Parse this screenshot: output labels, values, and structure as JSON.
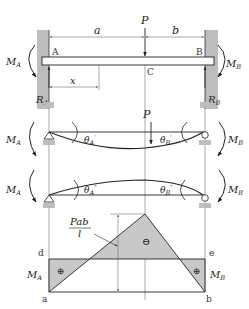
{
  "figure": {
    "colors": {
      "ink": "#222222",
      "fill_gray": "#c8c8c8",
      "wall_gray": "#bdbdbd",
      "background": "#ffffff"
    }
  },
  "panel1": {
    "load_label": "P",
    "dim_a": "a",
    "dim_b": "b",
    "dim_x": "x",
    "point_A": "A",
    "point_B": "B",
    "point_C": "C",
    "moment_left": "M",
    "moment_left_sub": "A",
    "moment_right": "M",
    "moment_right_sub": "B",
    "reaction_left": "R",
    "reaction_left_sub": "A",
    "reaction_right": "R",
    "reaction_right_sub": "B"
  },
  "panel2": {
    "load_label": "P",
    "moment_left": "M",
    "moment_left_sub": "A",
    "moment_right": "M",
    "moment_right_sub": "B",
    "theta_left": "θ",
    "theta_left_sub": "A",
    "theta_left_sup": "′",
    "theta_right": "θ",
    "theta_right_sub": "B",
    "theta_right_sup": "′"
  },
  "panel3": {
    "moment_left": "M",
    "moment_left_sub": "A",
    "moment_right": "M",
    "moment_right_sub": "B",
    "theta_left": "θ",
    "theta_left_sub": "A",
    "theta_left_sup": "″",
    "theta_right": "θ",
    "theta_right_sub": "B",
    "theta_right_sup": "″"
  },
  "moment_diagram": {
    "peak_label_num": "Pab",
    "peak_label_den": "l",
    "sign_center": "⊖",
    "sign_left": "⊕",
    "sign_right": "⊕",
    "point_a": "a",
    "point_b": "b",
    "point_d": "d",
    "point_e": "e",
    "moment_left": "M",
    "moment_left_sub": "A",
    "moment_right": "M",
    "moment_right_sub": "B"
  }
}
